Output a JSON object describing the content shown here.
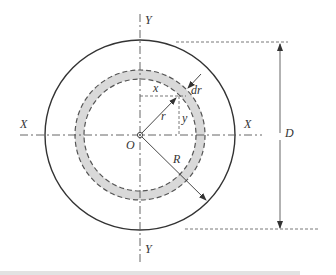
{
  "diagram": {
    "labels": {
      "axis_y_top": "Y",
      "axis_y_bottom": "Y",
      "axis_x_left": "X",
      "axis_x_right": "X",
      "origin": "O",
      "radius_small": "r",
      "radius_large": "R",
      "ring_thickness": "dr",
      "coord_x": "x",
      "coord_y": "y",
      "diameter": "D"
    },
    "colors": {
      "stroke": "#333333",
      "ring_fill": "#d9d9d9",
      "dim_line": "#555555"
    }
  }
}
